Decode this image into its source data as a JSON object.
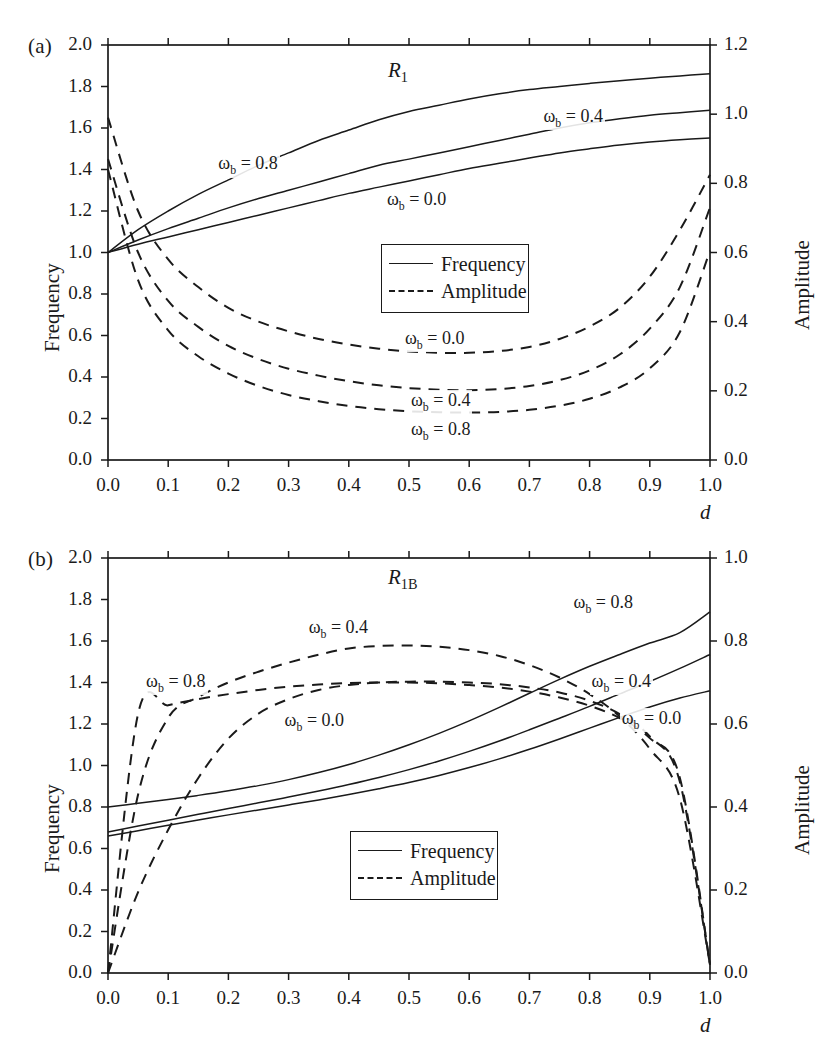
{
  "figure": {
    "kind": "two-panel line plot",
    "panels": [
      {
        "tag": "(a)",
        "title_main": "R",
        "title_sub": "1",
        "xlabel": "d",
        "ylabel_left": "Frequency",
        "ylabel_right": "Amplitude",
        "xticks": [
          "0.0",
          "0.1",
          "0.2",
          "0.3",
          "0.4",
          "0.5",
          "0.6",
          "0.7",
          "0.8",
          "0.9",
          "1.0"
        ],
        "yticks_left": [
          "2.0",
          "1.8",
          "1.6",
          "1.4",
          "1.2",
          "1.0",
          "0.8",
          "0.6",
          "0.4",
          "0.2",
          "0.0"
        ],
        "yticks_right": [
          "1.2",
          "1.0",
          "0.8",
          "0.6",
          "0.4",
          "0.2",
          "0.0"
        ],
        "legend": [
          {
            "label": "Frequency",
            "style": "solid"
          },
          {
            "label": "Amplitude",
            "style": "dashed"
          }
        ],
        "curve_labels": [
          {
            "omega": "0.8",
            "kind": "frequency"
          },
          {
            "omega": "0.4",
            "kind": "frequency"
          },
          {
            "omega": "0.0",
            "kind": "frequency"
          },
          {
            "omega": "0.0",
            "kind": "amplitude"
          },
          {
            "omega": "0.4",
            "kind": "amplitude"
          },
          {
            "omega": "0.8",
            "kind": "amplitude"
          }
        ]
      },
      {
        "tag": "(b)",
        "title_main": "R",
        "title_sub": "1B",
        "xlabel": "d",
        "ylabel_left": "Frequency",
        "ylabel_right": "Amplitude",
        "xticks": [
          "0.0",
          "0.1",
          "0.2",
          "0.3",
          "0.4",
          "0.5",
          "0.6",
          "0.7",
          "0.8",
          "0.9",
          "1.0"
        ],
        "yticks_left": [
          "2.0",
          "1.8",
          "1.6",
          "1.4",
          "1.2",
          "1.0",
          "0.8",
          "0.6",
          "0.4",
          "0.2",
          "0.0"
        ],
        "yticks_right": [
          "1.0",
          "0.8",
          "0.6",
          "0.4",
          "0.2",
          "0.0"
        ],
        "legend": [
          {
            "label": "Frequency",
            "style": "solid"
          },
          {
            "label": "Amplitude",
            "style": "dashed"
          }
        ],
        "curve_labels": [
          {
            "omega": "0.8",
            "kind": "amplitude"
          },
          {
            "omega": "0.4",
            "kind": "amplitude"
          },
          {
            "omega": "0.0",
            "kind": "amplitude"
          },
          {
            "omega": "0.8",
            "kind": "frequency"
          },
          {
            "omega": "0.4",
            "kind": "frequency"
          },
          {
            "omega": "0.0",
            "kind": "frequency"
          }
        ]
      }
    ],
    "omega_symbol": "ω",
    "omega_subscript": "b",
    "equals": " = ",
    "line_color": "#1a1a1a"
  },
  "chart_data": [
    {
      "type": "line",
      "title": "R1",
      "xlabel": "d",
      "ylabel": "Frequency",
      "ylabel_right": "Amplitude",
      "xlim": [
        0.0,
        1.0
      ],
      "ylim": [
        0.0,
        2.0
      ],
      "ylim_right": [
        0.0,
        1.2
      ],
      "grid": false,
      "legend": [
        "Frequency",
        "Amplitude"
      ],
      "legend_position": "center",
      "x": [
        0.0,
        0.05,
        0.1,
        0.15,
        0.2,
        0.25,
        0.3,
        0.35,
        0.4,
        0.45,
        0.5,
        0.55,
        0.6,
        0.65,
        0.7,
        0.75,
        0.8,
        0.85,
        0.9,
        0.95,
        1.0
      ],
      "series": [
        {
          "name": "Frequency, omega_b = 0.8",
          "axis": "left",
          "style": "solid",
          "values": [
            1.0,
            1.11,
            1.2,
            1.28,
            1.35,
            1.42,
            1.48,
            1.54,
            1.59,
            1.64,
            1.68,
            1.71,
            1.74,
            1.765,
            1.785,
            1.8,
            1.815,
            1.828,
            1.84,
            1.851,
            1.862
          ]
        },
        {
          "name": "Frequency, omega_b = 0.4",
          "axis": "left",
          "style": "solid",
          "values": [
            1.0,
            1.06,
            1.115,
            1.165,
            1.215,
            1.26,
            1.3,
            1.34,
            1.38,
            1.42,
            1.45,
            1.48,
            1.51,
            1.54,
            1.57,
            1.6,
            1.625,
            1.645,
            1.662,
            1.674,
            1.685
          ]
        },
        {
          "name": "Frequency, omega_b = 0.0",
          "axis": "left",
          "style": "solid",
          "values": [
            1.0,
            1.04,
            1.075,
            1.11,
            1.145,
            1.18,
            1.215,
            1.25,
            1.285,
            1.315,
            1.345,
            1.375,
            1.405,
            1.43,
            1.455,
            1.48,
            1.5,
            1.518,
            1.532,
            1.543,
            1.552
          ]
        },
        {
          "name": "Amplitude, omega_b = 0.0",
          "axis": "right",
          "style": "dashed",
          "values": [
            0.99,
            0.72,
            0.58,
            0.5,
            0.44,
            0.4,
            0.372,
            0.35,
            0.334,
            0.322,
            0.314,
            0.31,
            0.31,
            0.315,
            0.327,
            0.35,
            0.386,
            0.44,
            0.53,
            0.665,
            0.825
          ]
        },
        {
          "name": "Amplitude, omega_b = 0.4",
          "axis": "right",
          "style": "dashed",
          "values": [
            0.87,
            0.6,
            0.46,
            0.385,
            0.33,
            0.292,
            0.264,
            0.244,
            0.228,
            0.216,
            0.208,
            0.203,
            0.202,
            0.205,
            0.214,
            0.231,
            0.259,
            0.305,
            0.38,
            0.5,
            0.73
          ]
        },
        {
          "name": "Amplitude, omega_b = 0.8",
          "axis": "right",
          "style": "dashed",
          "values": [
            0.84,
            0.52,
            0.375,
            0.3,
            0.25,
            0.214,
            0.188,
            0.17,
            0.156,
            0.147,
            0.141,
            0.138,
            0.137,
            0.139,
            0.145,
            0.157,
            0.177,
            0.21,
            0.265,
            0.37,
            0.605
          ]
        }
      ],
      "annotations": [
        {
          "text": "omega_b = 0.8",
          "x": 0.18,
          "y": 1.42
        },
        {
          "text": "omega_b = 0.4",
          "x": 0.72,
          "y": 1.65
        },
        {
          "text": "omega_b = 0.0",
          "x": 0.46,
          "y": 1.25
        },
        {
          "text": "omega_b = 0.0",
          "x": 0.49,
          "y": 0.58
        },
        {
          "text": "omega_b = 0.4",
          "x": 0.5,
          "y": 0.28
        },
        {
          "text": "omega_b = 0.8",
          "x": 0.5,
          "y": 0.14
        }
      ]
    },
    {
      "type": "line",
      "title": "R1B",
      "xlabel": "d",
      "ylabel": "Frequency",
      "ylabel_right": "Amplitude",
      "xlim": [
        0.0,
        1.0
      ],
      "ylim": [
        0.0,
        2.0
      ],
      "ylim_right": [
        0.0,
        1.0
      ],
      "grid": false,
      "legend": [
        "Frequency",
        "Amplitude"
      ],
      "legend_position": "lower-center",
      "x": [
        0.0,
        0.05,
        0.1,
        0.15,
        0.2,
        0.25,
        0.3,
        0.35,
        0.4,
        0.45,
        0.5,
        0.55,
        0.6,
        0.65,
        0.7,
        0.75,
        0.8,
        0.85,
        0.9,
        0.95,
        1.0
      ],
      "series": [
        {
          "name": "Frequency, omega_b = 0.8",
          "axis": "left",
          "style": "solid",
          "values": [
            0.8,
            0.818,
            0.836,
            0.856,
            0.878,
            0.903,
            0.932,
            0.966,
            1.005,
            1.05,
            1.1,
            1.155,
            1.215,
            1.28,
            1.348,
            1.415,
            1.478,
            1.535,
            1.59,
            1.64,
            1.74
          ]
        },
        {
          "name": "Frequency, omega_b = 0.4",
          "axis": "left",
          "style": "solid",
          "values": [
            0.68,
            0.708,
            0.736,
            0.765,
            0.793,
            0.82,
            0.848,
            0.877,
            0.908,
            0.942,
            0.98,
            1.022,
            1.068,
            1.118,
            1.172,
            1.228,
            1.285,
            1.345,
            1.405,
            1.468,
            1.535
          ]
        },
        {
          "name": "Frequency, omega_b = 0.0",
          "axis": "left",
          "style": "solid",
          "values": [
            0.66,
            0.686,
            0.712,
            0.737,
            0.762,
            0.786,
            0.81,
            0.834,
            0.86,
            0.888,
            0.918,
            0.952,
            0.99,
            1.032,
            1.078,
            1.128,
            1.18,
            1.232,
            1.282,
            1.325,
            1.36
          ]
        },
        {
          "name": "Amplitude, omega_b = 0.8",
          "axis": "right",
          "style": "dashed",
          "values": [
            0.0,
            0.625,
            0.645,
            0.66,
            0.672,
            0.682,
            0.69,
            0.695,
            0.699,
            0.7,
            0.7,
            0.698,
            0.694,
            0.688,
            0.678,
            0.664,
            0.644,
            0.614,
            0.566,
            0.47,
            0.02
          ]
        },
        {
          "name": "Amplitude, omega_b = 0.4",
          "axis": "right",
          "style": "dashed",
          "values": [
            0.0,
            0.43,
            0.615,
            0.665,
            0.7,
            0.726,
            0.748,
            0.767,
            0.782,
            0.788,
            0.789,
            0.786,
            0.778,
            0.764,
            0.742,
            0.712,
            0.672,
            0.618,
            0.54,
            0.42,
            0.02
          ]
        },
        {
          "name": "Amplitude, omega_b = 0.0",
          "axis": "right",
          "style": "dashed",
          "values": [
            0.0,
            0.195,
            0.345,
            0.47,
            0.565,
            0.625,
            0.66,
            0.682,
            0.694,
            0.7,
            0.702,
            0.702,
            0.7,
            0.696,
            0.688,
            0.676,
            0.656,
            0.624,
            0.57,
            0.46,
            0.02
          ]
        }
      ],
      "annotations": [
        {
          "text": "omega_b = 0.8",
          "x": 0.06,
          "y": 1.4
        },
        {
          "text": "omega_b = 0.4",
          "x": 0.33,
          "y": 1.66
        },
        {
          "text": "omega_b = 0.0",
          "x": 0.29,
          "y": 1.21
        },
        {
          "text": "omega_b = 0.8",
          "x": 0.77,
          "y": 1.78
        },
        {
          "text": "omega_b = 0.4",
          "x": 0.8,
          "y": 1.4
        },
        {
          "text": "omega_b = 0.0",
          "x": 0.85,
          "y": 1.22
        }
      ]
    }
  ]
}
